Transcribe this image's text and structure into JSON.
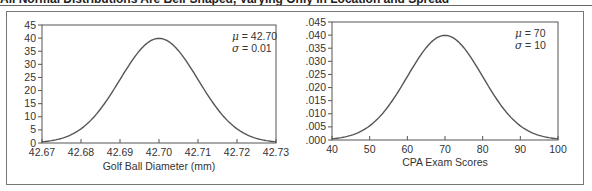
{
  "figure": {
    "title_fragment": "All Normal Distributions Are Bell-Shaped, Varying Only in Location and Spread"
  },
  "chart_data": [
    {
      "type": "line",
      "title": "",
      "xlabel": "Golf Ball Diameter (mm)",
      "ylabel": "",
      "xlim": [
        42.67,
        42.73
      ],
      "ylim": [
        0,
        45
      ],
      "x_ticks": [
        "42.67",
        "42.68",
        "42.69",
        "42.70",
        "42.71",
        "42.72",
        "42.73"
      ],
      "y_ticks": [
        "0",
        "5",
        "10",
        "15",
        "20",
        "25",
        "30",
        "35",
        "40",
        "45"
      ],
      "grid": false,
      "annotation": {
        "mu_label": "μ = 42.70",
        "sigma_label": "σ = 0.01",
        "mu": 42.7,
        "sigma": 0.01
      },
      "series": [
        {
          "name": "Normal PDF",
          "x": [
            42.67,
            42.675,
            42.68,
            42.685,
            42.69,
            42.695,
            42.7,
            42.705,
            42.71,
            42.715,
            42.72,
            42.725,
            42.73
          ],
          "y": [
            0.44,
            1.75,
            5.4,
            12.95,
            24.2,
            35.21,
            39.89,
            35.21,
            24.2,
            12.95,
            5.4,
            1.75,
            0.44
          ]
        }
      ]
    },
    {
      "type": "line",
      "title": "",
      "xlabel": "CPA Exam Scores",
      "ylabel": "",
      "xlim": [
        40,
        100
      ],
      "ylim": [
        0,
        0.045
      ],
      "x_ticks": [
        "40",
        "50",
        "60",
        "70",
        "80",
        "90",
        "100"
      ],
      "y_ticks": [
        ".000",
        ".005",
        ".010",
        ".015",
        ".020",
        ".025",
        ".030",
        ".035",
        ".040",
        ".045"
      ],
      "grid": false,
      "annotation": {
        "mu_label": "μ = 70",
        "sigma_label": "σ = 10",
        "mu": 70,
        "sigma": 10
      },
      "series": [
        {
          "name": "Normal PDF",
          "x": [
            40,
            45,
            50,
            55,
            60,
            65,
            70,
            75,
            80,
            85,
            90,
            95,
            100
          ],
          "y": [
            0.00044,
            0.00175,
            0.0054,
            0.01295,
            0.0242,
            0.03521,
            0.03989,
            0.03521,
            0.0242,
            0.01295,
            0.0054,
            0.00175,
            0.00044
          ]
        }
      ]
    }
  ],
  "colors": {
    "line": "#555555",
    "axis": "#555555",
    "frame": "#777777",
    "background": "#ffffff"
  }
}
